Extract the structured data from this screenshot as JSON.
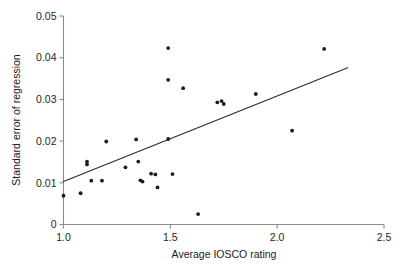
{
  "chart_data": {
    "type": "scatter",
    "title": "",
    "xlabel": "Average IOSCO rating",
    "ylabel": "Standard error of regression",
    "xlim": [
      1.0,
      2.5
    ],
    "ylim": [
      0.0,
      0.05
    ],
    "xticks": [
      1.0,
      1.5,
      2.0,
      2.5
    ],
    "xtick_labels": [
      "1.0",
      "1.5",
      "2.0",
      "2.5"
    ],
    "yticks": [
      0,
      0.01,
      0.02,
      0.03,
      0.04,
      0.05
    ],
    "ytick_labels": [
      "0",
      "0.01",
      "0.02",
      "0.03",
      "0.04",
      "0.05"
    ],
    "grid": false,
    "legend": null,
    "marker": "filled-circle",
    "marker_color": "#1c1c1c",
    "points": [
      {
        "x": 1.0,
        "y": 0.0069
      },
      {
        "x": 1.08,
        "y": 0.0075
      },
      {
        "x": 1.11,
        "y": 0.0151
      },
      {
        "x": 1.11,
        "y": 0.0144
      },
      {
        "x": 1.13,
        "y": 0.0105
      },
      {
        "x": 1.18,
        "y": 0.0105
      },
      {
        "x": 1.2,
        "y": 0.0199
      },
      {
        "x": 1.29,
        "y": 0.0137
      },
      {
        "x": 1.34,
        "y": 0.0204
      },
      {
        "x": 1.35,
        "y": 0.0151
      },
      {
        "x": 1.36,
        "y": 0.0106
      },
      {
        "x": 1.37,
        "y": 0.0103
      },
      {
        "x": 1.41,
        "y": 0.0122
      },
      {
        "x": 1.43,
        "y": 0.012
      },
      {
        "x": 1.44,
        "y": 0.0089
      },
      {
        "x": 1.49,
        "y": 0.0423
      },
      {
        "x": 1.49,
        "y": 0.0347
      },
      {
        "x": 1.49,
        "y": 0.0205
      },
      {
        "x": 1.51,
        "y": 0.0121
      },
      {
        "x": 1.56,
        "y": 0.0327
      },
      {
        "x": 1.63,
        "y": 0.0025
      },
      {
        "x": 1.72,
        "y": 0.0293
      },
      {
        "x": 1.74,
        "y": 0.0296
      },
      {
        "x": 1.75,
        "y": 0.0289
      },
      {
        "x": 1.9,
        "y": 0.0313
      },
      {
        "x": 2.07,
        "y": 0.0225
      },
      {
        "x": 2.22,
        "y": 0.0421
      }
    ],
    "fit_line": {
      "label": "regression line",
      "x0": 1.0,
      "y0": 0.0103,
      "x1": 2.33,
      "y1": 0.0376,
      "color": "#2b2b2b"
    }
  }
}
